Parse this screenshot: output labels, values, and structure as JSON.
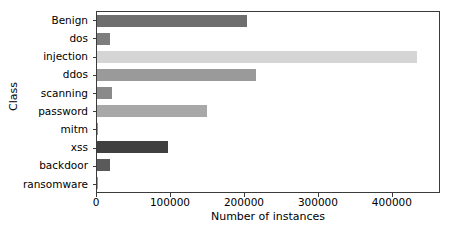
{
  "chart_data": {
    "type": "bar",
    "orientation": "horizontal",
    "title": "",
    "xlabel": "Number of instances",
    "ylabel": "Class",
    "categories": [
      "Benign",
      "dos",
      "injection",
      "ddos",
      "scanning",
      "password",
      "mitm",
      "xss",
      "backdoor",
      "ransomware"
    ],
    "values": [
      204000,
      17500,
      435000,
      216000,
      20000,
      149000,
      1200,
      97000,
      18000,
      900
    ],
    "bar_colors": [
      "#6e6e6e",
      "#7d7d7d",
      "#d5d5d5",
      "#9a9a9a",
      "#8a8a8a",
      "#a8a8a8",
      "#8f8f8f",
      "#404040",
      "#5a5a5a",
      "#9a9a9a"
    ],
    "xlim": [
      0,
      465000
    ],
    "xticks": [
      0,
      100000,
      200000,
      300000,
      400000
    ],
    "xticklabels": [
      "0",
      "100000",
      "200000",
      "300000",
      "400000"
    ],
    "grid": false,
    "legend": null
  }
}
